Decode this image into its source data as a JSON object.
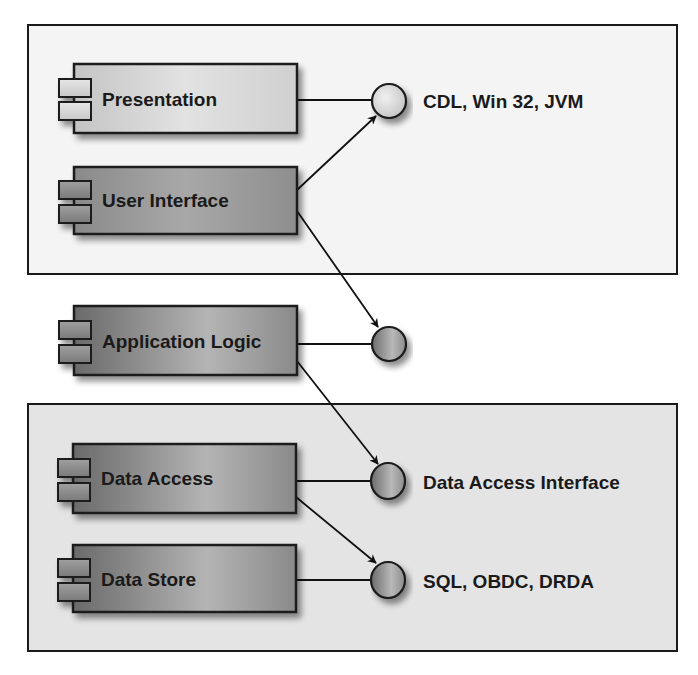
{
  "diagram": {
    "type": "UML component diagram",
    "packages": [
      {
        "id": "top",
        "fill": "#f4f4f4"
      },
      {
        "id": "bottom",
        "fill": "#e4e4e4"
      }
    ],
    "components": [
      {
        "id": "presentation",
        "label": "Presentation",
        "shade": "light"
      },
      {
        "id": "user-interface",
        "label": "User Interface",
        "shade": "medium"
      },
      {
        "id": "application-logic",
        "label": "Application Logic",
        "shade": "dark"
      },
      {
        "id": "data-access",
        "label": "Data Access",
        "shade": "dark"
      },
      {
        "id": "data-store",
        "label": "Data Store",
        "shade": "dark"
      }
    ],
    "interfaces": [
      {
        "id": "cdl",
        "label": "CDL, Win 32, JVM",
        "shade": "light"
      },
      {
        "id": "app-logic-interface",
        "label": "",
        "shade": "dark"
      },
      {
        "id": "data-access-interface",
        "label": "Data Access Interface",
        "shade": "dark"
      },
      {
        "id": "sql",
        "label": "SQL, OBDC, DRDA",
        "shade": "dark"
      }
    ],
    "connections": [
      {
        "from": "presentation",
        "to": "cdl",
        "kind": "realization-line"
      },
      {
        "from": "user-interface",
        "to": "cdl",
        "kind": "dependency-arrow"
      },
      {
        "from": "user-interface",
        "to": "app-logic-interface",
        "kind": "dependency-arrow"
      },
      {
        "from": "application-logic",
        "to": "app-logic-interface",
        "kind": "realization-line"
      },
      {
        "from": "application-logic",
        "to": "data-access-interface",
        "kind": "dependency-arrow"
      },
      {
        "from": "data-access",
        "to": "data-access-interface",
        "kind": "realization-line"
      },
      {
        "from": "data-access",
        "to": "sql",
        "kind": "dependency-arrow"
      },
      {
        "from": "data-store",
        "to": "sql",
        "kind": "realization-line"
      }
    ]
  }
}
